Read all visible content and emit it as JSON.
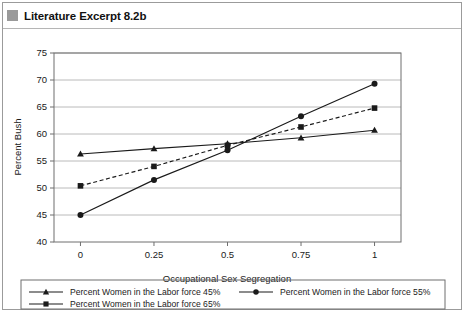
{
  "figure": {
    "title": "Literature Excerpt 8.2b",
    "title_swatch_color": "#9a9a9a",
    "frame_color": "#9b9b9b"
  },
  "caption": {
    "text": ""
  },
  "chart_data": {
    "type": "line",
    "title": "",
    "xlabel": "Occupational Sex Segregation",
    "ylabel": "Percent Bush",
    "x": [
      0,
      0.25,
      0.5,
      0.75,
      1
    ],
    "xtick_labels": [
      "0",
      "0.25",
      "0.5",
      "0.75",
      "1"
    ],
    "ytick_labels": [
      "40",
      "45",
      "50",
      "55",
      "60",
      "65",
      "70",
      "75"
    ],
    "xlim": [
      -0.09,
      1.09
    ],
    "ylim": [
      40,
      75
    ],
    "grid": "horizontal",
    "legend_position": "below-plot",
    "series": [
      {
        "name": "Percent Women in the Labor force 45%",
        "values": [
          56.3,
          57.3,
          58.2,
          59.3,
          60.7
        ],
        "marker": "triangle",
        "line_style": "solid",
        "color": "#1a1a1a"
      },
      {
        "name": "Percent Women in the Labor force 55%",
        "values": [
          45.0,
          51.5,
          57.0,
          63.3,
          69.3
        ],
        "marker": "circle",
        "line_style": "solid",
        "color": "#1a1a1a"
      },
      {
        "name": "Percent Women in the Labor force 65%",
        "values": [
          50.4,
          54.0,
          57.9,
          61.3,
          64.8
        ],
        "marker": "square",
        "line_style": "dashed",
        "color": "#1a1a1a"
      }
    ]
  }
}
